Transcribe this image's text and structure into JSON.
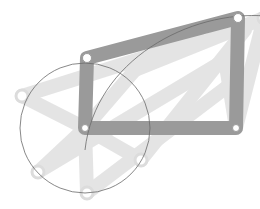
{
  "diagram": {
    "colors": {
      "link": "#9a9a9a",
      "ghost": "#d8d8d8",
      "joint_fill": "#ffffff",
      "circle_stroke": "#6a6a6a",
      "background": "#ffffff"
    },
    "joints": {
      "ground_left": [
        85,
        128
      ],
      "ground_right": [
        236,
        128
      ],
      "crank_tip": [
        87,
        58
      ],
      "rocker_tip": [
        238,
        18
      ]
    },
    "crank_circle": {
      "cx": 85,
      "cy": 128,
      "r": 65
    },
    "ghost_crank_tips": [
      [
        22,
        96
      ],
      [
        38,
        172
      ],
      [
        87,
        193
      ],
      [
        141,
        160
      ],
      [
        135,
        70
      ],
      [
        264,
        18
      ]
    ],
    "path_arc_end": [
      266,
      16
    ]
  }
}
